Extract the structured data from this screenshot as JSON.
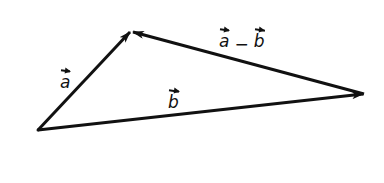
{
  "diagram": {
    "type": "vector-triangle",
    "colors": {
      "stroke": "#111111",
      "background": "#ffffff"
    },
    "points": {
      "origin": [
        38,
        130
      ],
      "tip_a": [
        131,
        31
      ],
      "tip_b": [
        364,
        94
      ]
    },
    "vectors": [
      {
        "id": "a",
        "from": "origin",
        "to": "tip_a",
        "label": "a"
      },
      {
        "id": "b",
        "from": "origin",
        "to": "tip_b",
        "label": "b"
      },
      {
        "id": "a_minus_b",
        "from": "tip_b",
        "to": "tip_a",
        "label_parts": [
          "a",
          "−",
          "b"
        ]
      }
    ],
    "labels": {
      "a": "a",
      "b": "b",
      "diff_a": "a",
      "diff_op": "−",
      "diff_b": "b"
    }
  }
}
